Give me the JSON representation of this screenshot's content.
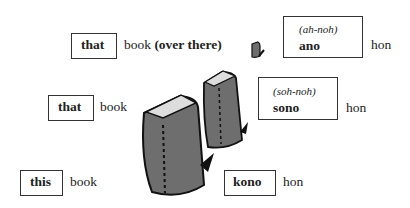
{
  "rows": [
    {
      "key": "that_over_there",
      "en_box": "that",
      "en_text": "book",
      "en_bold_suffix": "(over there)",
      "jp_pron": "(ah-noh)",
      "jp_word": "ano",
      "jp_noun": "hon"
    },
    {
      "key": "that",
      "en_box": "that",
      "en_text": "book",
      "jp_pron": "(soh-noh)",
      "jp_word": "sono",
      "jp_noun": "hon"
    },
    {
      "key": "this",
      "en_box": "this",
      "en_text": "book",
      "jp_word": "kono",
      "jp_noun": "hon"
    }
  ],
  "illustration": {
    "icon": "book-icon",
    "count": 3,
    "fill": "#6e6e6e"
  }
}
